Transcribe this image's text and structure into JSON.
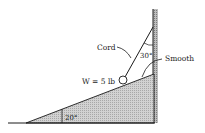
{
  "diagram": {
    "labels": {
      "cord": "Cord",
      "cord_angle": "30°",
      "smooth": "Smooth",
      "weight": "W = 5 lb",
      "incline_angle": "20°"
    },
    "colors": {
      "line": "#1a1a1a",
      "incline_fill": "#c8c8c8",
      "wall_hatch": "#9a9a9a",
      "background": "#ffffff"
    }
  }
}
